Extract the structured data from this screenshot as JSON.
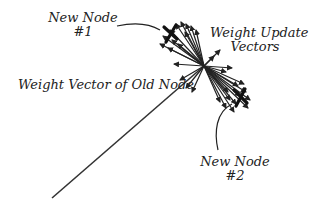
{
  "diagram": {
    "labels": {
      "new_node_1": [
        "New Node",
        "#1"
      ],
      "new_node_2": [
        "New Node",
        "#2"
      ],
      "weight_update": [
        "Weight Update",
        "Vectors"
      ],
      "old_vector": "Weight Vector of Old Node"
    },
    "colors": {
      "ink": "#222222",
      "background": "#ffffff"
    },
    "elements": [
      {
        "id": "old-node-weight-vector",
        "type": "arrow",
        "label": "Weight Vector of Old Node"
      },
      {
        "id": "weight-update-vectors",
        "type": "arrow-burst",
        "label": "Weight Update Vectors"
      },
      {
        "id": "new-node-1-marker",
        "type": "cross",
        "label": "New Node #1"
      },
      {
        "id": "new-node-2-marker",
        "type": "cross",
        "label": "New Node #2"
      }
    ]
  }
}
